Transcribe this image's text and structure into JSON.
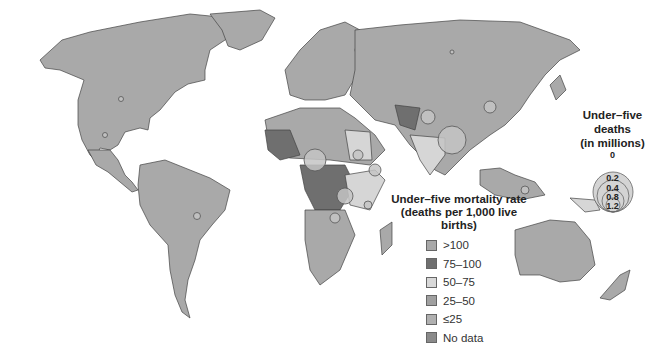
{
  "map": {
    "type": "choropleth with proportional symbols",
    "subject": "Under-five mortality worldwide",
    "colors": {
      "gt100": "#a8a8a8",
      "75_100": "#6f6f6f",
      "50_75": "#d8d8d8",
      "25_50": "#a0a0a0",
      "le25": "#b0b0b0",
      "no_data": "#8a8a8a",
      "bubble": "#c4c4c4"
    }
  },
  "legend_rate": {
    "title_line1": "Under–five mortality rate",
    "title_line2": "(deaths per 1,000 live births)",
    "items": [
      {
        "label": ">100",
        "color": "#a8a8a8"
      },
      {
        "label": "75–100",
        "color": "#6f6f6f"
      },
      {
        "label": "50–75",
        "color": "#d8d8d8"
      },
      {
        "label": "25–50",
        "color": "#a0a0a0"
      },
      {
        "label": "≤25",
        "color": "#b0b0b0"
      },
      {
        "label": "No data",
        "color": "#8a8a8a"
      }
    ]
  },
  "legend_deaths": {
    "title_line1": "Under–five deaths",
    "title_line2": "(in millions)",
    "values": [
      "0",
      "0.2",
      "0.4",
      "0.8",
      "1.2"
    ]
  }
}
